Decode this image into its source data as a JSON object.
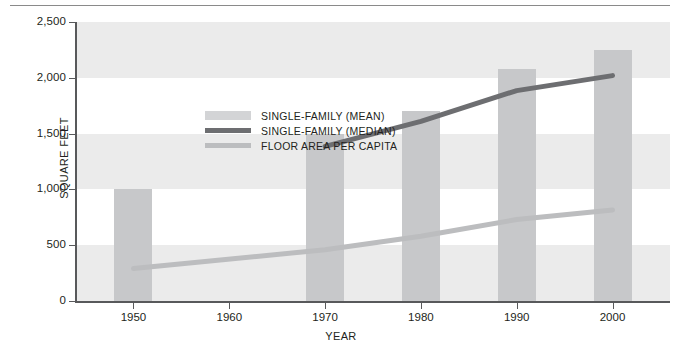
{
  "chart_data": {
    "type": "bar",
    "title": "",
    "xlabel": "YEAR",
    "ylabel": "SQUARE FEET",
    "categories": [
      "1950",
      "1960",
      "1970",
      "1980",
      "1990",
      "2000"
    ],
    "x": [
      1950,
      1960,
      1970,
      1980,
      1990,
      2000
    ],
    "xlim": [
      1944,
      2006
    ],
    "ylim": [
      0,
      2500
    ],
    "ytick_labels": [
      "0",
      "500",
      "1,000",
      "1,500",
      "2,000",
      "2,500"
    ],
    "ytick_values": [
      0,
      500,
      1000,
      1500,
      2000,
      2500
    ],
    "grid": "alternating horizontal bands",
    "legend_position": "upper-left inside plot",
    "series": [
      {
        "name": "SINGLE-FAMILY (MEAN)",
        "kind": "bar",
        "color": "#c7c8ca",
        "x": [
          1950,
          1970,
          1980,
          1990,
          2000
        ],
        "values": [
          1000,
          1500,
          1700,
          2080,
          2250
        ]
      },
      {
        "name": "SINGLE-FAMILY (MEDIAN)",
        "kind": "line",
        "color": "#6d6e71",
        "x": [
          1970,
          1980,
          1990,
          2000
        ],
        "values": [
          1385,
          1610,
          1885,
          2020
        ]
      },
      {
        "name": "FLOOR AREA PER CAPITA",
        "kind": "line",
        "color": "#bcbdbf",
        "x": [
          1950,
          1970,
          1980,
          1990,
          2000
        ],
        "values": [
          290,
          460,
          580,
          730,
          815
        ]
      }
    ]
  },
  "axes": {
    "y_title": "SQUARE FEET",
    "x_title": "YEAR",
    "y_ticks": [
      {
        "label": "2,500",
        "value": 2500
      },
      {
        "label": "2,000",
        "value": 2000
      },
      {
        "label": "1,500",
        "value": 1500
      },
      {
        "label": "1,000",
        "value": 1000
      },
      {
        "label": "500",
        "value": 500
      },
      {
        "label": "0",
        "value": 0
      }
    ],
    "x_ticks": [
      {
        "label": "1950",
        "value": 1950
      },
      {
        "label": "1960",
        "value": 1960
      },
      {
        "label": "1970",
        "value": 1970
      },
      {
        "label": "1980",
        "value": 1980
      },
      {
        "label": "1990",
        "value": 1990
      },
      {
        "label": "2000",
        "value": 2000
      }
    ]
  },
  "legend": {
    "items": [
      {
        "label": "SINGLE-FAMILY (MEAN)",
        "swatch": "bar",
        "color": "#d3d4d6"
      },
      {
        "label": "SINGLE-FAMILY (MEDIAN)",
        "swatch": "line",
        "color": "#6d6e71"
      },
      {
        "label": "FLOOR AREA PER CAPITA",
        "swatch": "line",
        "color": "#bcbdbf"
      }
    ]
  },
  "colors": {
    "bar": "#c7c8ca",
    "median_line": "#6d6e71",
    "capita_line": "#bcbdbf",
    "band": "#ebebeb",
    "axis": "#58595b",
    "text": "#231f20",
    "rule": "#8a8a8a"
  }
}
